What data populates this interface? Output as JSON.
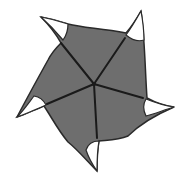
{
  "diagram": {
    "type": "pinwheel-star",
    "arms": 5,
    "colors": {
      "background": "#ffffff",
      "body_fill": "#6e6e6e",
      "outline": "#2a2a2a",
      "tip_fill": "#ffffff",
      "spoke": "#1a1a1a"
    },
    "center": [
      94,
      84
    ],
    "spokes": [
      {
        "name": "spoke-top-left",
        "end": [
          61,
          43
        ]
      },
      {
        "name": "spoke-top-right",
        "end": [
          125,
          38
        ]
      },
      {
        "name": "spoke-right",
        "end": [
          143,
          98
        ]
      },
      {
        "name": "spoke-bottom",
        "end": [
          97,
          138
        ]
      },
      {
        "name": "spoke-left",
        "end": [
          47,
          104
        ]
      }
    ],
    "tips": [
      {
        "name": "tip-top-left",
        "point": [
          41,
          17
        ]
      },
      {
        "name": "tip-top-right",
        "point": [
          141,
          11
        ]
      },
      {
        "name": "tip-right",
        "point": [
          174,
          107
        ]
      },
      {
        "name": "tip-bottom",
        "point": [
          97,
          171
        ]
      },
      {
        "name": "tip-left",
        "point": [
          17,
          117
        ]
      }
    ]
  }
}
